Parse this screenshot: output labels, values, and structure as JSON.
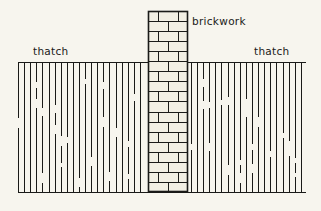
{
  "figure": {
    "background_color": "#f7f5ee",
    "ink_color": "#1a1a18",
    "brick_fill_color": "#f2efe4",
    "width": 321,
    "height": 211
  },
  "labels": {
    "brickwork": "brickwork",
    "thatch_left": "thatch",
    "thatch_right": "thatch"
  },
  "geometry": {
    "baseline_y": 192,
    "thatch_top_y": 62,
    "thatch_left_x": 18,
    "thatch_right_x": 305,
    "column_left_x": 148,
    "column_right_x": 188,
    "column_top_y": 11,
    "column_bottom_y": 192,
    "course_height": 10.05,
    "course_count": 18,
    "thatch_line_spacing": 6.1,
    "bond_pattern": "stretcher"
  },
  "chart_data": {
    "type": "diagram",
    "elements": [
      {
        "name": "brick-column",
        "label": "brickwork",
        "x_range": [
          148,
          188
        ],
        "y_range": [
          11,
          192
        ],
        "courses": 18,
        "bond": "stretcher"
      },
      {
        "name": "thatch-left",
        "label": "thatch",
        "x_range": [
          18,
          148
        ],
        "y_range": [
          62,
          192
        ],
        "hatch": "broken-vertical"
      },
      {
        "name": "thatch-right",
        "label": "thatch",
        "x_range": [
          188,
          305
        ],
        "y_range": [
          62,
          192
        ],
        "hatch": "broken-vertical"
      },
      {
        "name": "ground-line",
        "label": "",
        "x_range": [
          18,
          305
        ],
        "y_range": [
          192,
          192
        ],
        "hatch": "solid"
      }
    ]
  }
}
